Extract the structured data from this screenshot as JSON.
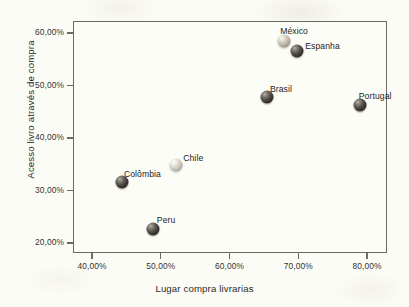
{
  "chart_data": {
    "type": "scatter",
    "title": "",
    "xlabel": "Lugar compra livrarias",
    "ylabel": "Acesso  livro através de compra",
    "xlim": [
      36.0,
      81.6
    ],
    "ylim": [
      18.0,
      62.3
    ],
    "grid": false,
    "legend": "none (points labelled directly)",
    "xticks": [
      "40,00%",
      "50,00%",
      "60,00%",
      "70,00%",
      "80,00%"
    ],
    "xtick_values": [
      40,
      50,
      60,
      70,
      80
    ],
    "yticks": [
      "20,00%",
      "30,00%",
      "40,00%",
      "50,00%",
      "60,00%"
    ],
    "ytick_values": [
      20,
      30,
      40,
      50,
      60
    ],
    "points": [
      {
        "label": "México",
        "x": 67.8,
        "y": 58.6,
        "marker": "sphere",
        "shade": "medium",
        "label_dx": -4,
        "label_dy": -15
      },
      {
        "label": "Espanha",
        "x": 69.7,
        "y": 56.7,
        "marker": "sphere",
        "shade": "dark",
        "label_dx": 8,
        "label_dy": -10
      },
      {
        "label": "Brasil",
        "x": 65.3,
        "y": 48.0,
        "marker": "sphere",
        "shade": "dark",
        "label_dx": 3,
        "label_dy": -13
      },
      {
        "label": "Portugal",
        "x": 78.8,
        "y": 46.4,
        "marker": "sphere",
        "shade": "dark",
        "label_dx": -1,
        "label_dy": -14
      },
      {
        "label": "Chile",
        "x": 52.1,
        "y": 35.1,
        "marker": "sphere",
        "shade": "light",
        "label_dx": 7,
        "label_dy": -12
      },
      {
        "label": "Colômbia",
        "x": 44.2,
        "y": 31.8,
        "marker": "sphere",
        "shade": "dark",
        "label_dx": 2,
        "label_dy": -13
      },
      {
        "label": "Peru",
        "x": 48.7,
        "y": 22.9,
        "marker": "sphere",
        "shade": "dark",
        "label_dx": 4,
        "label_dy": -14
      }
    ]
  },
  "colors": {
    "background": "#fcfcf6",
    "plot_background": "#fdfdf7",
    "frame": "#6d6b60",
    "text": "#2b2b28",
    "marker_dark": "#342f2b",
    "marker_light": "#d3d0c4",
    "marker_medium": "#bebaac"
  }
}
